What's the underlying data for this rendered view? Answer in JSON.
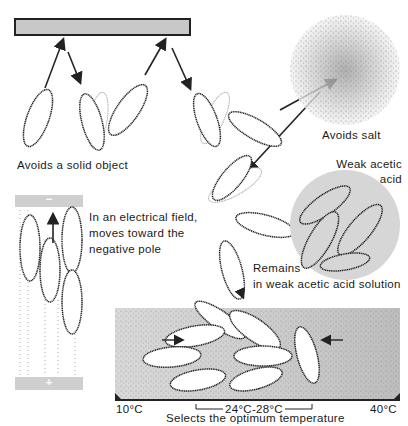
{
  "diagram": {
    "labels": {
      "solid_object": "Avoids a solid object",
      "salt": "Avoids salt",
      "acid_title_line1": "Weak acetic",
      "acid_title_line2": "acid",
      "electrical_line1": "In an electrical field,",
      "electrical_line2": "moves toward the",
      "electrical_line3": "negative pole",
      "remains_line1": "Remains",
      "remains_line2": "in weak acetic acid solution",
      "temp_low": "10°C",
      "temp_range": "24°C-28°C",
      "temp_high": "40°C",
      "temp_caption": "Selects the optimum temperature"
    },
    "poles": {
      "negative": "−",
      "positive": "+"
    },
    "colors": {
      "solid_bar": "#c8c8c8",
      "acid_circle": "#d6d6d6",
      "pole_plate": "#cfcfcf",
      "temp_field": "#dcdcdc",
      "outline": "#222222"
    }
  }
}
